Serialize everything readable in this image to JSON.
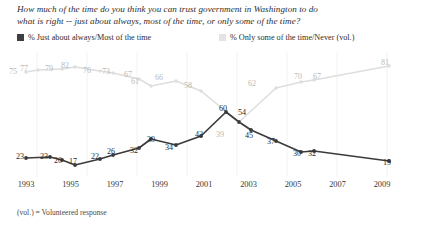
{
  "question": {
    "line1": "How much of the time do you think you can trust government in Washington to do",
    "line2": "what is right -- just about always, most of the time, or only some of the time?"
  },
  "legend": {
    "items": [
      {
        "label": "% Just about always/Most of the time",
        "color": "#3f3f41",
        "swatch": "dark-swatch"
      },
      {
        "label": "% Only some of the time/Never (vol.)",
        "color": "#e3e3e3",
        "swatch": "light-swatch"
      }
    ]
  },
  "footnote": "(vol.) = Volunteered response",
  "axis": {
    "ticks": [
      "1993",
      "1995",
      "1997",
      "1999",
      "2001",
      "2003",
      "2005",
      "2007",
      "2009"
    ]
  },
  "chart_data": {
    "type": "line",
    "title": "How much of the time do you think you can trust government in Washington to do what is right -- just about always, most of the time, or only some of the time?",
    "xlabel": "",
    "ylabel": "",
    "ylim": [
      0,
      100
    ],
    "grid": false,
    "legend_position": "top",
    "x": [
      "1993",
      "1994",
      "1995",
      "1996",
      "1997",
      "1998",
      "1999",
      "2000",
      "2001",
      "2002",
      "2003",
      "2004",
      "2005",
      "2006",
      "2007",
      "2008",
      "2009",
      "2010"
    ],
    "series": [
      {
        "name": "% Just about always/Most of the time",
        "color": "#3f3f41",
        "values": [
          23,
          23,
          20,
          17,
          22,
          26,
          32,
          39,
          34,
          42,
          60,
          54,
          45,
          37,
          30,
          32,
          null,
          19
        ],
        "labels": [
          "23",
          "23",
          "20",
          "17",
          "22",
          "26",
          "32",
          "39",
          "34",
          "42",
          "60",
          "54",
          "45",
          "37",
          "30",
          "32",
          "",
          "19"
        ]
      },
      {
        "name": "% Only some of the time/Never (vol.)",
        "color": "#dcdcdc",
        "values": [
          75,
          77,
          79,
          82,
          76,
          73,
          67,
          61,
          66,
          58,
          39,
          null,
          null,
          62,
          70,
          67,
          null,
          81
        ],
        "labels": [
          "75",
          "77",
          "79",
          "82",
          "76",
          "73",
          "67",
          "61",
          "66",
          "58",
          "39",
          "",
          "",
          "62",
          "70",
          "67",
          "",
          "81"
        ]
      }
    ],
    "annotations": [
      "(vol.) = Volunteered response"
    ]
  },
  "points": {
    "dark": [
      {
        "v": "23",
        "x": 26,
        "y": 158,
        "lx": 19,
        "ly": 152
      },
      {
        "v": "23",
        "x": 50,
        "y": 157,
        "lx": 43,
        "ly": 152
      },
      {
        "v": "20",
        "x": 62,
        "y": 160,
        "lx": 57,
        "ly": 156
      },
      {
        "v": "17",
        "x": 75,
        "y": 165,
        "lx": 72,
        "ly": 157
      },
      {
        "v": "22",
        "x": 100,
        "y": 159,
        "lx": 94,
        "ly": 152
      },
      {
        "v": "26",
        "x": 113,
        "y": 155,
        "lx": 110,
        "ly": 147
      },
      {
        "v": "32",
        "x": 139,
        "y": 148,
        "lx": 133,
        "ly": 146
      },
      {
        "v": "39",
        "x": 151,
        "y": 139,
        "lx": 150,
        "ly": 135
      },
      {
        "v": "34",
        "x": 176,
        "y": 145,
        "lx": 168,
        "ly": 143
      },
      {
        "v": "42",
        "x": 201,
        "y": 136,
        "lx": 198,
        "ly": 130
      },
      {
        "v": "60",
        "x": 226,
        "y": 112,
        "lx": 222,
        "ly": 104
      },
      {
        "v": "54",
        "x": 239,
        "y": 122,
        "lx": 241,
        "ly": 108
      },
      {
        "v": "45",
        "x": 251,
        "y": 130,
        "lx": 248,
        "ly": 131
      },
      {
        "v": "37",
        "x": 276,
        "y": 141,
        "lx": 270,
        "ly": 137
      },
      {
        "v": "30",
        "x": 301,
        "y": 152,
        "lx": 296,
        "ly": 149
      },
      {
        "v": "32",
        "x": 314,
        "y": 151,
        "lx": 311,
        "ly": 149
      },
      {
        "v": "19",
        "x": 389,
        "y": 161,
        "lx": 386,
        "ly": 158
      }
    ],
    "light": [
      {
        "v": "75",
        "x": 26,
        "y": 72,
        "lx": 12,
        "ly": 67
      },
      {
        "v": "77",
        "x": 38,
        "y": 70,
        "lx": 23,
        "ly": 64
      },
      {
        "v": "79",
        "x": 62,
        "y": 69,
        "lx": 48,
        "ly": 64
      },
      {
        "v": "82",
        "x": 75,
        "y": 67,
        "lx": 64,
        "ly": 61
      },
      {
        "v": "76",
        "x": 100,
        "y": 71,
        "lx": 86,
        "ly": 66
      },
      {
        "v": "73",
        "x": 113,
        "y": 73,
        "lx": 105,
        "ly": 67
      },
      {
        "v": "67",
        "x": 139,
        "y": 79,
        "lx": 127,
        "ly": 70
      },
      {
        "v": "61",
        "x": 151,
        "y": 86,
        "lx": 134,
        "ly": 77
      },
      {
        "v": "66",
        "x": 176,
        "y": 81,
        "lx": 158,
        "ly": 73
      },
      {
        "v": "58",
        "x": 201,
        "y": 91,
        "lx": 187,
        "ly": 81
      },
      {
        "v": "39",
        "x": 239,
        "y": 122,
        "lx": 219,
        "ly": 130
      },
      {
        "v": "62",
        "x": 276,
        "y": 88,
        "lx": 251,
        "ly": 79
      },
      {
        "v": "70",
        "x": 301,
        "y": 82,
        "lx": 297,
        "ly": 72
      },
      {
        "v": "67",
        "x": 314,
        "y": 80,
        "lx": 316,
        "ly": 72
      },
      {
        "v": "81",
        "x": 389,
        "y": 66,
        "lx": 384,
        "ly": 58
      }
    ]
  }
}
